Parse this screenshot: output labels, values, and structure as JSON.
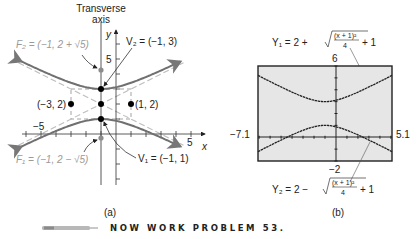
{
  "figure_a": {
    "caption": "(a)",
    "transverse_axis_label_line1": "Transverse",
    "transverse_axis_label_line2": "axis",
    "x_axis_label": "x",
    "y_axis_label": "y",
    "tick_label_x_neg5": "−5",
    "tick_label_x_5": "5",
    "tick_label_y_5": "5",
    "F2_label": "F₂ = (−1, 2 + √5)",
    "V2_label": "V₂ = (−1, 3)",
    "V1_label": "V₁ = (−1, 1)",
    "F1_label": "F₁ = (−1, 2 − √5)",
    "left_point_label": "(−3, 2)",
    "right_point_label": "(1, 2)",
    "colors": {
      "curve": "#6f6f6f",
      "asymptote": "#b5b5b5",
      "focus": "#8c8c8c",
      "point": "#000000"
    }
  },
  "figure_b": {
    "caption": "(b)",
    "y1_prefix": "Y₁ = 2 + ",
    "y2_prefix": "Y₂ = 2 − ",
    "frac_num": "(x + 1)²",
    "frac_den": "4",
    "plus_one": "+ 1",
    "ymax_label": "6",
    "ymin_label": "−2",
    "xmin_label": "−7.1",
    "xmax_label": "5.1",
    "screen_color": "#e6e6e6"
  },
  "footer": {
    "text": "NOW WORK PROBLEM 53."
  },
  "chart_data": [
    {
      "type": "line",
      "title": "Hyperbola (y − 2)² − (x + 1)²/4 = 1",
      "xlabel": "x",
      "ylabel": "y",
      "xlim": [
        -5.5,
        6
      ],
      "ylim": [
        -2.5,
        6.5
      ],
      "grid": false,
      "center": [
        -1,
        2
      ],
      "vertices": [
        [
          -1,
          3
        ],
        [
          -1,
          1
        ]
      ],
      "foci": [
        [
          -1,
          4.236
        ],
        [
          -1,
          -0.236
        ]
      ],
      "box_points": [
        [
          -3,
          2
        ],
        [
          1,
          2
        ]
      ],
      "asymptotes": [
        "y − 2 = (x + 1)/2",
        "y − 2 = −(x + 1)/2"
      ],
      "tick_labels": {
        "x": [
          "−5",
          "5"
        ],
        "y": [
          "5"
        ]
      },
      "annotations": [
        "Transverse axis",
        "F₂ = (−1, 2 + √5)",
        "V₂ = (−1, 3)",
        "V₁ = (−1, 1)",
        "F₁ = (−1, 2 − √5)",
        "(−3, 2)",
        "(1, 2)"
      ]
    },
    {
      "type": "line",
      "title": "Graphing calculator view",
      "xlim": [
        -7.1,
        5.1
      ],
      "ylim": [
        -2,
        6
      ],
      "series": [
        {
          "name": "Y₁ = 2 + √((x + 1)²/4 + 1)",
          "x": [
            -7.1,
            -5,
            -3,
            -1,
            1,
            3,
            5.1
          ],
          "values": [
            5.52,
            4.24,
            3.41,
            3.0,
            3.41,
            4.24,
            5.32
          ]
        },
        {
          "name": "Y₂ = 2 − √((x + 1)²/4 + 1)",
          "x": [
            -7.1,
            -5,
            -3,
            -1,
            1,
            3,
            5.1
          ],
          "values": [
            -1.52,
            -0.24,
            0.59,
            1.0,
            0.59,
            -0.24,
            -1.32
          ]
        }
      ],
      "tick_labels": {
        "xmin": "−7.1",
        "xmax": "5.1",
        "ymin": "−2",
        "ymax": "6"
      }
    }
  ]
}
